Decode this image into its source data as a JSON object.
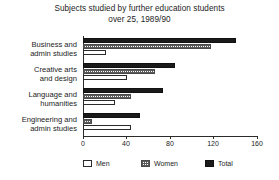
{
  "chart_data": {
    "type": "bar",
    "orientation": "horizontal",
    "title": "Subjects studied by further education students over 25, 1989/90",
    "title_line1": "Subjects studied by further education students",
    "title_line2": "over 25, 1989/90",
    "xlabel": "",
    "ylabel": "",
    "xlim": [
      0,
      174
    ],
    "xticks": [
      0,
      40,
      80,
      120,
      160
    ],
    "xtick_labels": [
      "0",
      "40",
      "80",
      "120",
      "160"
    ],
    "grid": false,
    "legend_position": "bottom",
    "categories": [
      "Business and admin studies",
      "Creative arts and design",
      "Language and humanities",
      "Engineering and admin studies"
    ],
    "category_lines": [
      [
        "Business and",
        "admin studies"
      ],
      [
        "Creative arts",
        "and design"
      ],
      [
        "Language and",
        "humanities"
      ],
      [
        "Engineering and",
        "admin studies"
      ]
    ],
    "series": [
      {
        "name": "Men",
        "values": [
          23,
          44,
          32,
          48
        ],
        "color": "#ffffff",
        "pattern": "outline"
      },
      {
        "name": "Women",
        "values": [
          128,
          72,
          48,
          9
        ],
        "color": "#5a5a5a",
        "pattern": "dotted-hatch"
      },
      {
        "name": "Total",
        "values": [
          153,
          92,
          80,
          57
        ],
        "color": "#1a1a1a",
        "pattern": "solid"
      }
    ]
  },
  "legend": {
    "items": [
      {
        "label": "Men"
      },
      {
        "label": "Women"
      },
      {
        "label": "Total"
      }
    ]
  }
}
